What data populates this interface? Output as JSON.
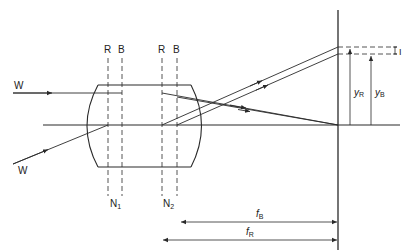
{
  "diagram": {
    "colors": {
      "stroke": "#2a2a2a",
      "background": "#ffffff"
    },
    "labels": {
      "ray_top": "W",
      "ray_bottom": "W",
      "plane1_red": "R",
      "plane1_blue": "B",
      "plane2_red": "R",
      "plane2_blue": "B",
      "nodal1": "N",
      "nodal1_sub": "1",
      "nodal2": "N",
      "nodal2_sub": "2",
      "image_height_red": "y",
      "image_height_red_sub": "R",
      "image_height_blue": "y",
      "image_height_blue_sub": "B",
      "image_size": "I",
      "focal_blue": "f",
      "focal_blue_sub": "B",
      "focal_red": "f",
      "focal_red_sub": "R"
    }
  }
}
